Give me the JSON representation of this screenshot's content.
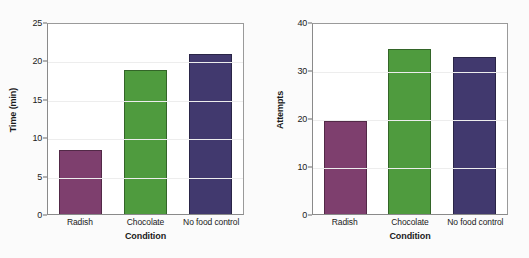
{
  "credit": "© Cengage Learning",
  "chart_data": [
    {
      "type": "bar",
      "panel": "left",
      "title": "",
      "xlabel": "Condition",
      "ylabel": "Time (min)",
      "categories": [
        "Radish",
        "Chocolate",
        "No food control"
      ],
      "values": [
        8.4,
        18.7,
        20.8
      ],
      "ylim": [
        0,
        25
      ],
      "yticks": [
        0,
        5,
        10,
        15,
        20,
        25
      ],
      "ytick_labels": [
        "0",
        "5",
        "10",
        "15",
        "20",
        "25"
      ],
      "grid": true,
      "legend": "none",
      "bar_colors": [
        "#7E3F6E",
        "#4F9B3E",
        "#41396E"
      ]
    },
    {
      "type": "bar",
      "panel": "right",
      "title": "",
      "xlabel": "Condition",
      "ylabel": "Attempts",
      "categories": [
        "Radish",
        "Chocolate",
        "No food control"
      ],
      "values": [
        19.4,
        34.3,
        32.8
      ],
      "ylim": [
        0,
        40
      ],
      "yticks": [
        0,
        10,
        20,
        30,
        40
      ],
      "ytick_labels": [
        "0",
        "10",
        "20",
        "30",
        "40"
      ],
      "grid": true,
      "legend": "none",
      "bar_colors": [
        "#7E3F6E",
        "#4F9B3E",
        "#41396E"
      ]
    }
  ]
}
